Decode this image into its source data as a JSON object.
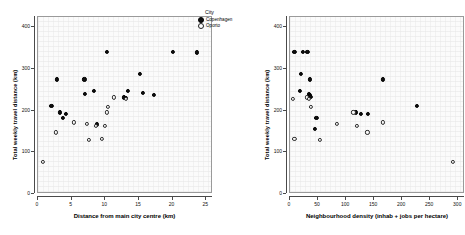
{
  "figure": {
    "panels": 2,
    "background": "#ffffff",
    "plot_background": "#fbfbfb",
    "frame_color": "#9a9a9a"
  },
  "legend": {
    "title": "City",
    "position": "top-right",
    "entries": [
      {
        "label": "Copenhagen",
        "marker": "filled-circle",
        "color": "#111111"
      },
      {
        "label": "Oporto",
        "marker": "open-circle",
        "color": "#ffffff"
      }
    ]
  },
  "chart_data": [
    {
      "id": "left",
      "type": "scatter",
      "title": "",
      "xlabel": "Distance from main city centre (km)",
      "ylabel": "Total weekly travel distance (km)",
      "xlim": [
        0,
        26
      ],
      "ylim": [
        0,
        425
      ],
      "xticks": [
        0,
        5,
        10,
        15,
        20,
        25
      ],
      "yticks": [
        0,
        100,
        200,
        300,
        400
      ],
      "xticklabels": [
        "0",
        "5",
        "10",
        "15",
        "20",
        "25"
      ],
      "yticklabels": [
        "0",
        "100",
        "200",
        "300",
        "400"
      ],
      "grid": true,
      "legend": "top-right outside",
      "series": [
        {
          "name": "Copenhagen",
          "marker": "filled-circle",
          "points": [
            [
              2.0,
              212
            ],
            [
              2.8,
              275
            ],
            [
              3.2,
              196
            ],
            [
              3.7,
              183
            ],
            [
              4.2,
              192
            ],
            [
              6.9,
              275
            ],
            [
              7.0,
              240
            ],
            [
              8.3,
              247
            ],
            [
              8.8,
              167
            ],
            [
              10.2,
              342
            ],
            [
              12.8,
              232
            ],
            [
              13.1,
              230
            ],
            [
              13.3,
              247
            ],
            [
              15.2,
              288
            ],
            [
              15.6,
              243
            ],
            [
              17.2,
              238
            ],
            [
              20.0,
              342
            ],
            [
              23.6,
              340
            ]
          ]
        },
        {
          "name": "Oporto",
          "marker": "open-circle",
          "points": [
            [
              0.7,
              77
            ],
            [
              2.6,
              148
            ],
            [
              5.3,
              172
            ],
            [
              7.3,
              168
            ],
            [
              7.6,
              129
            ],
            [
              8.6,
              163
            ],
            [
              9.5,
              133
            ],
            [
              9.9,
              164
            ],
            [
              10.2,
              196
            ],
            [
              10.4,
              210
            ],
            [
              11.3,
              232
            ],
            [
              13.0,
              228
            ]
          ]
        }
      ]
    },
    {
      "id": "right",
      "type": "scatter",
      "title": "",
      "xlabel": "Neighbourhood density (inhab + jobs per hectare)",
      "ylabel": "Total weekly travel distance (km)",
      "xlim": [
        0,
        312
      ],
      "ylim": [
        0,
        425
      ],
      "xticks": [
        0,
        50,
        100,
        150,
        200,
        250,
        300
      ],
      "yticks": [
        0,
        100,
        200,
        300,
        400
      ],
      "xticklabels": [
        "0",
        "50",
        "100",
        "150",
        "200",
        "250",
        "300"
      ],
      "yticklabels": [
        "0",
        "100",
        "200",
        "300",
        "400"
      ],
      "grid": true,
      "legend": "none",
      "series": [
        {
          "name": "Copenhagen",
          "marker": "filled-circle",
          "points": [
            [
              8,
              342
            ],
            [
              23,
              342
            ],
            [
              31,
              342
            ],
            [
              20,
              288
            ],
            [
              35,
              275
            ],
            [
              18,
              247
            ],
            [
              33,
              240
            ],
            [
              35,
              238
            ],
            [
              36,
              236
            ],
            [
              37,
              234
            ],
            [
              47,
              183
            ],
            [
              45,
              157
            ],
            [
              118,
              196
            ],
            [
              127,
              193
            ],
            [
              139,
              192
            ],
            [
              166,
              275
            ],
            [
              226,
              212
            ]
          ]
        },
        {
          "name": "Oporto",
          "marker": "open-circle",
          "points": [
            [
              5,
              228
            ],
            [
              30,
              232
            ],
            [
              33,
              229
            ],
            [
              38,
              210
            ],
            [
              8,
              133
            ],
            [
              53,
              129
            ],
            [
              83,
              168
            ],
            [
              113,
              196
            ],
            [
              120,
              164
            ],
            [
              138,
              148
            ],
            [
              166,
              172
            ],
            [
              290,
              77
            ]
          ]
        }
      ]
    }
  ]
}
